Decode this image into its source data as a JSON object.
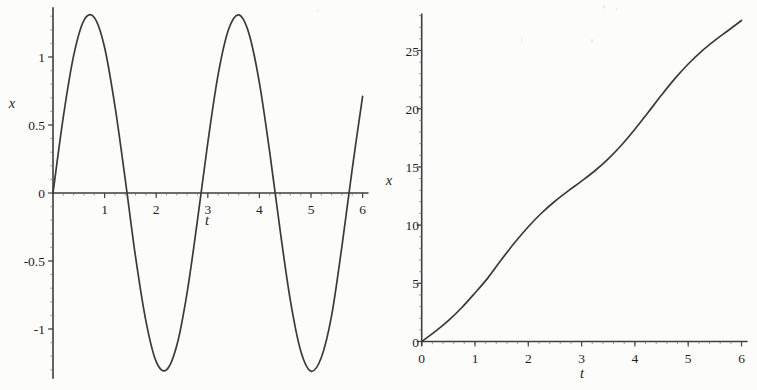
{
  "figure": {
    "description_colors": {
      "background": "#fcfcfa",
      "curve": "#3a3a3a",
      "axis": "#3d3d3d",
      "major_tick": "#444444",
      "minor_tick": "#6b6b6b",
      "label": "#1f1f1f"
    }
  },
  "chart_data": [
    {
      "id": "left",
      "type": "line",
      "title": "",
      "xlabel": "t",
      "ylabel": "x",
      "xlim": [
        0,
        6.1
      ],
      "ylim": [
        -1.36,
        1.36
      ],
      "grid": false,
      "legend": "none",
      "x_major_ticks": [
        1,
        2,
        3,
        4,
        5,
        6
      ],
      "x_tick_labels": [
        "1",
        "2",
        "3",
        "4",
        "5",
        "6"
      ],
      "y_major_ticks": [
        1,
        0.5,
        0,
        -0.5,
        -1
      ],
      "y_tick_labels": [
        "1",
        "0.5",
        "0",
        "-0.5",
        "-1"
      ],
      "x_minor_step": 0.2,
      "y_minor_step": 0.1,
      "x": [
        0,
        0.2,
        0.4,
        0.6,
        0.8,
        1,
        1.2,
        1.4,
        1.6,
        1.8,
        2,
        2.2,
        2.4,
        2.6,
        2.8,
        3,
        3.2,
        3.4,
        3.6,
        3.8,
        4,
        4.2,
        4.4,
        4.6,
        4.8,
        5,
        5.2,
        5.4,
        5.6,
        5.8,
        6
      ],
      "y": [
        0,
        0.56,
        1.01,
        1.27,
        1.29,
        1.07,
        0.64,
        0.1,
        -0.47,
        -0.94,
        -1.24,
        -1.3,
        -1.12,
        -0.73,
        -0.2,
        0.37,
        0.87,
        1.2,
        1.31,
        1.17,
        0.81,
        0.3,
        -0.27,
        -0.79,
        -1.16,
        -1.31,
        -1.21,
        -0.9,
        -0.39,
        0.18,
        0.71
      ]
    },
    {
      "id": "right",
      "type": "line",
      "title": "",
      "xlabel": "t",
      "ylabel": "x",
      "xlim": [
        0,
        6.1
      ],
      "ylim": [
        -0.3,
        28.1
      ],
      "grid": false,
      "legend": "none",
      "x_major_ticks": [
        0,
        1,
        2,
        3,
        4,
        5,
        6
      ],
      "x_tick_labels": [
        "0",
        "1",
        "2",
        "3",
        "4",
        "5",
        "6"
      ],
      "y_major_ticks": [
        0,
        5,
        10,
        15,
        20,
        25
      ],
      "y_tick_labels": [
        "0",
        "5",
        "10",
        "15",
        "20",
        "25"
      ],
      "x_minor_step": 0.2,
      "y_minor_step": 1,
      "x": [
        0,
        0.25,
        0.5,
        0.75,
        1,
        1.25,
        1.5,
        1.75,
        2,
        2.25,
        2.5,
        2.75,
        3,
        3.25,
        3.5,
        3.75,
        4,
        4.25,
        4.5,
        4.75,
        5,
        5.25,
        5.5,
        5.75,
        6
      ],
      "y": [
        0,
        0.85,
        1.8,
        2.9,
        4.17,
        5.51,
        7.06,
        8.52,
        9.86,
        11.04,
        12.05,
        12.94,
        13.78,
        14.67,
        15.69,
        16.88,
        18.23,
        19.69,
        21.17,
        22.58,
        23.84,
        24.93,
        25.87,
        26.72,
        27.58
      ]
    }
  ]
}
